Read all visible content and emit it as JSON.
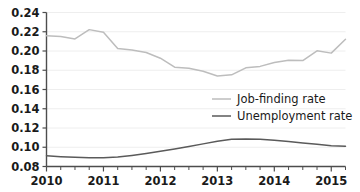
{
  "chart_data": {
    "type": "line",
    "title": "",
    "xlabel": "",
    "ylabel": "",
    "xlim": [
      2010.0,
      2015.25
    ],
    "ylim": [
      0.08,
      0.24
    ],
    "y_ticks": [
      0.08,
      0.1,
      0.12,
      0.14,
      0.16,
      0.18,
      0.2,
      0.22,
      0.24
    ],
    "y_tick_labels": [
      "0.08",
      "0.10",
      "0.12",
      "0.14",
      "0.16",
      "0.18",
      "0.20",
      "0.22",
      "0.24"
    ],
    "x_ticks": [
      2010,
      2011,
      2012,
      2013,
      2014,
      2015
    ],
    "x_tick_labels": [
      "2010",
      "2011",
      "2012",
      "2013",
      "2014",
      "2015"
    ],
    "x_minor_tick_step": 0.25,
    "grid": "horizontal",
    "legend_position": "center-right",
    "colors": {
      "job_finding_rate": "#bdbdbd",
      "unemployment_rate": "#5a5a5a",
      "axis": "#4d4d4d",
      "grid": "#eaeaea",
      "text": "#1a1a1a",
      "background": "#ffffff"
    },
    "x": [
      2010.0,
      2010.25,
      2010.5,
      2010.75,
      2011.0,
      2011.25,
      2011.5,
      2011.75,
      2012.0,
      2012.25,
      2012.5,
      2012.75,
      2013.0,
      2013.25,
      2013.5,
      2013.75,
      2014.0,
      2014.25,
      2014.5,
      2014.75,
      2015.0,
      2015.25
    ],
    "series": [
      {
        "name": "Job-finding rate",
        "color": "#bdbdbd",
        "values": [
          0.2158,
          0.215,
          0.2125,
          0.2222,
          0.2195,
          0.2025,
          0.201,
          0.1985,
          0.1925,
          0.1832,
          0.182,
          0.179,
          0.174,
          0.1752,
          0.1825,
          0.184,
          0.188,
          0.1905,
          0.19,
          0.2002,
          0.1978,
          0.2122
        ]
      },
      {
        "name": "Unemployment rate",
        "color": "#5a5a5a",
        "values": [
          0.0912,
          0.0902,
          0.0895,
          0.089,
          0.089,
          0.0898,
          0.0915,
          0.0935,
          0.0958,
          0.0982,
          0.1008,
          0.1035,
          0.1062,
          0.1082,
          0.1086,
          0.1082,
          0.1072,
          0.106,
          0.1045,
          0.103,
          0.1015,
          0.101
        ]
      }
    ],
    "legend": [
      {
        "label": "Job-finding rate",
        "color": "#bdbdbd"
      },
      {
        "label": "Unemployment rate",
        "color": "#5a5a5a"
      }
    ]
  }
}
